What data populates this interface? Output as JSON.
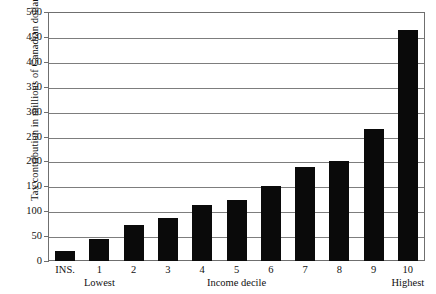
{
  "chart_data": {
    "type": "bar",
    "title": "",
    "subtitle": "",
    "xlabel": "Income decile",
    "ylabel": "Tax contribution in millions of Canadian dollars",
    "categories": [
      "INS.",
      "1",
      "2",
      "3",
      "4",
      "5",
      "6",
      "7",
      "8",
      "9",
      "10"
    ],
    "values": [
      20,
      45,
      73,
      86,
      112,
      122,
      150,
      188,
      201,
      266,
      464
    ],
    "ylim": [
      0,
      500
    ],
    "ytick_step": 50,
    "yticks": [
      0,
      50,
      100,
      150,
      200,
      250,
      300,
      350,
      400,
      450,
      500
    ],
    "ytick_labels": [
      "0",
      "50",
      "100",
      "150",
      "200",
      "250",
      "300",
      "350",
      "400",
      "450",
      "500"
    ],
    "grid": true,
    "legend": "none",
    "bar_color": "#0a0a0a",
    "grid_color": "#7d7d7d",
    "frame_color": "#6f6f6f",
    "annotations": [
      {
        "text": "Lowest",
        "under_category": "1"
      },
      {
        "text": "Income decile",
        "under_category": "5"
      },
      {
        "text": "Highest",
        "under_category": "10"
      }
    ]
  },
  "axis": {
    "y_title": "Tax contribution in millions of Canadian dollars"
  },
  "captions": {
    "lowest": "Lowest",
    "income_decile": "Income decile",
    "highest": "Highest"
  }
}
